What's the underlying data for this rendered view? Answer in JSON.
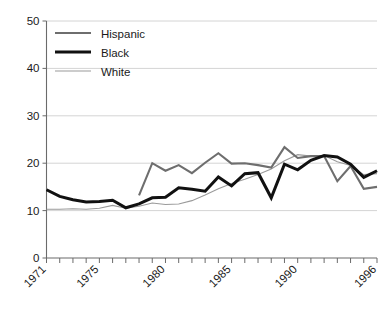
{
  "chart_data": {
    "type": "line",
    "title": "",
    "xlabel": "",
    "ylabel": "",
    "xlim": [
      1971,
      1996
    ],
    "ylim": [
      0,
      50
    ],
    "grid": true,
    "grid_axis": "y",
    "legend_position": "top-left",
    "yticks": [
      0,
      10,
      20,
      30,
      40,
      50
    ],
    "ytick_labels": [
      "0",
      "10",
      "20",
      "30",
      "40",
      "50"
    ],
    "xticks": [
      1971,
      1972,
      1973,
      1974,
      1975,
      1976,
      1977,
      1978,
      1979,
      1980,
      1981,
      1982,
      1983,
      1984,
      1985,
      1986,
      1987,
      1988,
      1989,
      1990,
      1991,
      1992,
      1993,
      1994,
      1995,
      1996
    ],
    "xtick_labels_shown": [
      "1971",
      "1975",
      "1980",
      "1985",
      "1990",
      "1996"
    ],
    "xtick_labels_shown_years": [
      1971,
      1975,
      1980,
      1985,
      1990,
      1996
    ],
    "xtick_label_rotation": -45,
    "series": [
      {
        "name": "Hispanic",
        "color": "#6e6e6e",
        "width": 2.1,
        "x": [
          1978,
          1979,
          1980,
          1981,
          1982,
          1983,
          1984,
          1985,
          1986,
          1987,
          1988,
          1989,
          1990,
          1991,
          1992,
          1993,
          1994,
          1995,
          1996
        ],
        "values": [
          13.2,
          20.0,
          18.4,
          19.6,
          17.9,
          20.1,
          22.1,
          19.9,
          20.0,
          19.6,
          19.1,
          23.4,
          21.1,
          21.5,
          21.5,
          16.2,
          19.4,
          14.6,
          15.0
        ]
      },
      {
        "name": "Black",
        "color": "#111111",
        "width": 3.0,
        "x": [
          1971,
          1972,
          1973,
          1974,
          1975,
          1976,
          1977,
          1978,
          1979,
          1980,
          1981,
          1982,
          1983,
          1984,
          1985,
          1986,
          1987,
          1988,
          1989,
          1990,
          1991,
          1992,
          1993,
          1994,
          1995,
          1996
        ],
        "values": [
          14.4,
          13.0,
          12.3,
          11.8,
          11.9,
          12.2,
          10.6,
          11.4,
          12.7,
          12.8,
          14.8,
          14.5,
          14.1,
          17.1,
          15.2,
          17.8,
          18.0,
          12.7,
          19.8,
          18.6,
          20.6,
          21.6,
          21.3,
          19.8,
          17.0,
          18.4
        ]
      },
      {
        "name": "White",
        "color": "#9a9a9a",
        "width": 1.1,
        "x": [
          1971,
          1972,
          1973,
          1974,
          1975,
          1976,
          1977,
          1978,
          1979,
          1980,
          1981,
          1982,
          1983,
          1984,
          1985,
          1986,
          1987,
          1988,
          1989,
          1990,
          1991,
          1992,
          1993,
          1994,
          1995,
          1996
        ],
        "values": [
          10.3,
          10.3,
          10.4,
          10.3,
          10.5,
          11.1,
          10.5,
          10.9,
          11.6,
          11.3,
          11.4,
          12.1,
          13.3,
          14.6,
          15.7,
          16.6,
          17.6,
          18.8,
          20.5,
          21.8,
          21.5,
          21.6,
          20.3,
          19.5,
          17.6,
          17.8
        ]
      }
    ]
  },
  "legend": {
    "entries": [
      {
        "label": "Hispanic"
      },
      {
        "label": "Black"
      },
      {
        "label": "White"
      }
    ]
  },
  "axis": {
    "y_labels": [
      "50",
      "40",
      "30",
      "20",
      "10",
      "0"
    ],
    "x_labels": [
      "1971",
      "1975",
      "1980",
      "1985",
      "1990",
      "1996"
    ]
  }
}
